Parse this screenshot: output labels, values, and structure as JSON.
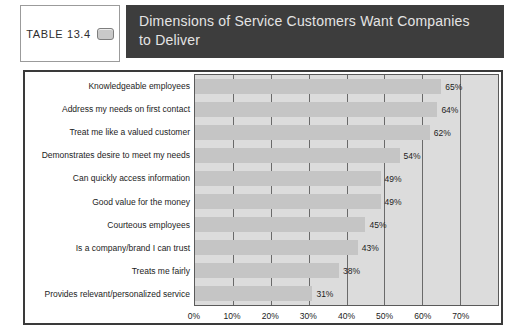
{
  "header": {
    "table_label": "TABLE 13.4",
    "icon": "table-tag-icon",
    "title": "Dimensions of Service Customers Want Companies to Deliver",
    "title_lines": [
      "Dimensions of Service Customers Want Companies",
      "to Deliver"
    ]
  },
  "colors": {
    "header_bg": "#3d3d3d",
    "header_text": "#e4e4e4",
    "panel_border": "#3a3a3a",
    "plot_bg": "#dcdcdc",
    "bar_fill": "#c5c5c5",
    "gridline": "#6a6a6a",
    "text": "#1c1c1c"
  },
  "chart_data": {
    "type": "bar",
    "orientation": "horizontal",
    "title": "Dimensions of Service Customers Want Companies to Deliver",
    "categories": [
      "Knowledgeable employees",
      "Address my needs on first contact",
      "Treat me like a valued customer",
      "Demonstrates desire to meet my needs",
      "Can quickly access information",
      "Good value for the money",
      "Courteous employees",
      "Is a company/brand I can trust",
      "Treats me fairly",
      "Provides relevant/personalized service"
    ],
    "values": [
      65,
      64,
      62,
      54,
      49,
      49,
      45,
      43,
      38,
      31
    ],
    "value_labels": [
      "65%",
      "64%",
      "62%",
      "54%",
      "49%",
      "49%",
      "45%",
      "43%",
      "38%",
      "31%"
    ],
    "x_ticks": [
      "0%",
      "10%",
      "20%",
      "30%",
      "40%",
      "50%",
      "60%",
      "70%"
    ],
    "xlim": [
      0,
      80
    ],
    "grid": true,
    "xlabel": "",
    "ylabel": ""
  }
}
